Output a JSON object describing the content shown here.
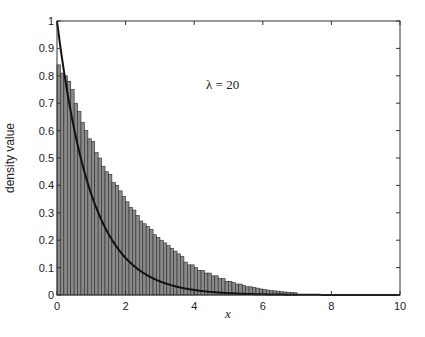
{
  "chart_data": {
    "type": "bar",
    "subtype": "histogram-with-density-curve",
    "title": "",
    "xlabel": "x",
    "ylabel": "density value",
    "xlim": [
      0,
      10
    ],
    "ylim": [
      0,
      1
    ],
    "xticks": [
      0,
      2,
      4,
      6,
      8,
      10
    ],
    "xtick_labels": [
      "0",
      "2",
      "4",
      "6",
      "8",
      "10"
    ],
    "yticks": [
      0,
      0.1,
      0.2,
      0.3,
      0.4,
      0.5,
      0.6,
      0.7,
      0.8,
      0.9,
      1
    ],
    "ytick_labels": [
      "0",
      "0.1",
      "0.2",
      "0.3",
      "0.4",
      "0.5",
      "0.6",
      "0.7",
      "0.8",
      "0.9",
      "1"
    ],
    "grid": false,
    "legend": null,
    "annotation": {
      "text": "λ = 20",
      "x": 5.3,
      "y": 0.77
    },
    "histogram": {
      "bin_width": 0.1,
      "bin_start": 0,
      "values": [
        0.84,
        0.81,
        0.8,
        0.78,
        0.75,
        0.7,
        0.67,
        0.63,
        0.6,
        0.57,
        0.56,
        0.52,
        0.5,
        0.47,
        0.45,
        0.44,
        0.41,
        0.4,
        0.38,
        0.36,
        0.34,
        0.32,
        0.31,
        0.29,
        0.27,
        0.26,
        0.25,
        0.24,
        0.22,
        0.21,
        0.2,
        0.19,
        0.18,
        0.17,
        0.16,
        0.15,
        0.14,
        0.12,
        0.11,
        0.11,
        0.1,
        0.09,
        0.09,
        0.08,
        0.08,
        0.07,
        0.07,
        0.06,
        0.06,
        0.05,
        0.05,
        0.045,
        0.04,
        0.04,
        0.035,
        0.03,
        0.03,
        0.028,
        0.025,
        0.022,
        0.02,
        0.018,
        0.016,
        0.015,
        0.014,
        0.012,
        0.011,
        0.01,
        0.009,
        0.008
      ]
    },
    "series": [
      {
        "name": "density curve",
        "type": "line",
        "function": "exp(-x)",
        "x": [
          0,
          0.5,
          1,
          1.5,
          2,
          2.5,
          3,
          3.5,
          4,
          5,
          6,
          7,
          8,
          9,
          10
        ],
        "values": [
          1.0,
          0.607,
          0.368,
          0.223,
          0.135,
          0.082,
          0.05,
          0.03,
          0.018,
          0.0067,
          0.0025,
          0.0009,
          0.0003,
          0.0001,
          0.0
        ]
      }
    ]
  },
  "labels": {
    "xlabel": "x",
    "ylabel": "density value",
    "annotation": "λ = 20"
  }
}
